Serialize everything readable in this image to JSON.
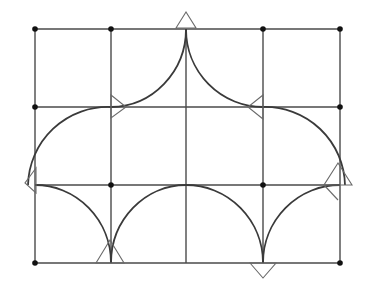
{
  "diagram": {
    "type": "geometric-construction",
    "colors": {
      "background": "#ffffff",
      "lines": "#4a4a4a",
      "arcs": "#3a3a3a",
      "markers": "#6a6a6a",
      "dots": "#111111"
    },
    "grid": {
      "columns_x": [
        35,
        111,
        186,
        263,
        340
      ],
      "rows_y": [
        29,
        107,
        185,
        263
      ]
    },
    "dots": [
      {
        "x": 35,
        "y": 29
      },
      {
        "x": 111,
        "y": 29
      },
      {
        "x": 263,
        "y": 29
      },
      {
        "x": 340,
        "y": 29
      },
      {
        "x": 35,
        "y": 107
      },
      {
        "x": 340,
        "y": 107
      },
      {
        "x": 111,
        "y": 185
      },
      {
        "x": 263,
        "y": 185
      },
      {
        "x": 35,
        "y": 263
      },
      {
        "x": 340,
        "y": 263
      }
    ],
    "arcs": [
      {
        "name": "upper-left-outer-arc",
        "d": "M 28 185 A 80 80 0 0 1 111 107"
      },
      {
        "name": "upper-left-inner-arc",
        "d": "M 111 107 A 76 78 0 0 0 186 29"
      },
      {
        "name": "upper-right-inner-arc",
        "d": "M 186 29 A 77 78 0 0 0 263 107"
      },
      {
        "name": "upper-right-outer-arc",
        "d": "M 263 107 A 80 80 0 0 1 345 185"
      },
      {
        "name": "lower-left-arc-1",
        "d": "M 35 185 A 76 78 0 0 1 111 263"
      },
      {
        "name": "lower-left-arc-2",
        "d": "M 111 263 A 75 78 0 0 1 186 185"
      },
      {
        "name": "lower-right-arc-1",
        "d": "M 186 185 A 77 78 0 0 1 263 263"
      },
      {
        "name": "lower-right-arc-2",
        "d": "M 263 263 A 77 78 0 0 1 340 185"
      }
    ],
    "markers": [
      {
        "name": "top-center-triangle",
        "points": "176,28 186,12 196,28"
      },
      {
        "name": "left-mid-triangle",
        "points": "111,95 126,107 111,118"
      },
      {
        "name": "right-mid-triangle",
        "points": "263,95 248,107 263,119"
      },
      {
        "name": "left-edge-triangle",
        "points": "36,168 25,183 36,193"
      },
      {
        "name": "right-edge-triangle",
        "points": "338,163 352,185 324,185"
      },
      {
        "name": "right-edge-extra-line",
        "points": "324,185 338,200"
      },
      {
        "name": "bottom-left-triangle",
        "points": "96,263 110,240 124,263"
      },
      {
        "name": "bottom-right-triangle",
        "points": "250,263 263,278 276,263"
      }
    ]
  }
}
